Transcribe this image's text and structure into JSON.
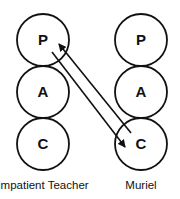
{
  "diagram": {
    "type": "transactional-analysis-ego-states",
    "persons": [
      {
        "label": "Impatient Teacher",
        "center_x": 43,
        "states": [
          {
            "letter": "P",
            "center_y": 40
          },
          {
            "letter": "A",
            "center_y": 92
          },
          {
            "letter": "C",
            "center_y": 144
          }
        ]
      },
      {
        "label": "Muriel",
        "center_x": 141,
        "states": [
          {
            "letter": "P",
            "center_y": 40
          },
          {
            "letter": "A",
            "center_y": 92
          },
          {
            "letter": "C",
            "center_y": 144
          }
        ]
      }
    ],
    "arrows": [
      {
        "from": "Impatient Teacher.P",
        "to": "Muriel.C",
        "x1": 52,
        "y1": 52,
        "x2": 125,
        "y2": 147
      },
      {
        "from": "Muriel.C",
        "to": "Impatient Teacher.P",
        "x1": 131,
        "y1": 133,
        "x2": 59,
        "y2": 44
      }
    ],
    "circle_radius": 26,
    "stroke_color": "#111111",
    "background": "#ffffff"
  }
}
